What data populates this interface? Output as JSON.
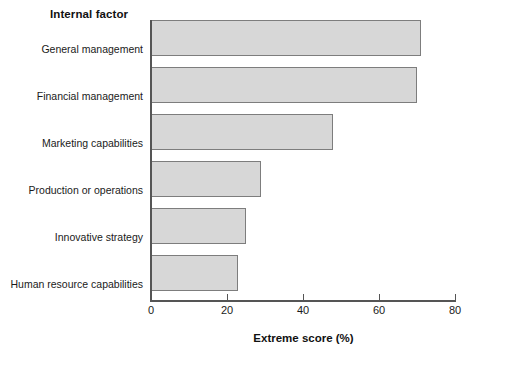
{
  "chart_data": {
    "type": "bar",
    "orientation": "horizontal",
    "title": "",
    "xlabel": "Extreme score (%)",
    "ylabel": "Internal factor",
    "categories": [
      "General management",
      "Financial management",
      "Marketing capabilities",
      "Production or operations",
      "Innovative strategy",
      "Human resource capabilities"
    ],
    "values": [
      71,
      70,
      48,
      29,
      25,
      23
    ],
    "xlim": [
      0,
      80
    ],
    "ticks": [
      0,
      20,
      40,
      60,
      80
    ],
    "tick_labels": [
      "0",
      "20",
      "40",
      "60",
      "80"
    ],
    "grid": false,
    "legend": false,
    "bar_fill_color": "#d7d7d7",
    "bar_border_color": "#7d7d7d",
    "axis_color": "#555555"
  }
}
